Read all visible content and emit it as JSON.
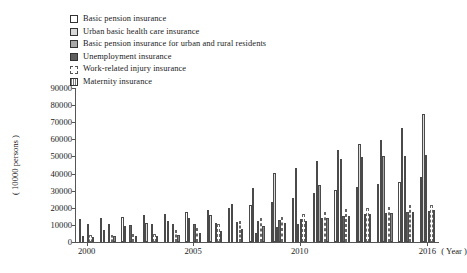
{
  "chart_data": {
    "type": "bar",
    "title": "",
    "xlabel": "( Year )",
    "ylabel": "( 10000 persons )",
    "ylim": [
      0,
      90000
    ],
    "ytick_values": [
      0,
      10000,
      20000,
      30000,
      40000,
      50000,
      60000,
      70000,
      80000,
      90000
    ],
    "ytick_labels": [
      "0",
      "10000",
      "20000",
      "30000",
      "40000",
      "50000",
      "60000",
      "70000",
      "80000",
      "90000"
    ],
    "grid": false,
    "legend_position": "top-left",
    "categories": [
      "2000",
      "2001",
      "2002",
      "2003",
      "2004",
      "2005",
      "2006",
      "2007",
      "2008",
      "2009",
      "2010",
      "2011",
      "2012",
      "2013",
      "2014",
      "2015",
      "2016"
    ],
    "xtick_labels": [
      "2000",
      "2005",
      "2010",
      "2016"
    ],
    "xtick_categories": [
      "2000",
      "2005",
      "2010",
      "2016"
    ],
    "series": [
      {
        "name": "Basic pension insurance",
        "swatch": "s0",
        "bar": "b0",
        "values": [
          13617,
          14183,
          14737,
          15507,
          16353,
          17488,
          18766,
          20137,
          21891,
          23550,
          25707,
          28391,
          30427,
          32218,
          34124,
          35361,
          37930
        ]
      },
      {
        "name": "Urban basic health care insurance",
        "swatch": "s1",
        "bar": "b1",
        "values": [
          3787,
          7286,
          9400,
          10902,
          12404,
          13783,
          15732,
          22311,
          31822,
          40147,
          43263,
          47343,
          53641,
          57073,
          59747,
          66582,
          74839
        ]
      },
      {
        "name": "Basic pension insurance for urban and rural residents",
        "swatch": "s2",
        "bar": "b2",
        "values": [
          0,
          0,
          0,
          0,
          0,
          0,
          0,
          0,
          5171,
          8691,
          10277,
          33218,
          48370,
          49750,
          50107,
          50472,
          50847
        ]
      },
      {
        "name": "Unemployment insurance",
        "swatch": "s3",
        "bar": "b3",
        "values": [
          10408,
          10355,
          10182,
          10373,
          10584,
          10648,
          11187,
          11645,
          12400,
          12715,
          13376,
          14317,
          15225,
          16417,
          17043,
          17326,
          18089
        ]
      },
      {
        "name": "Work-related injury insurance",
        "swatch": "s4",
        "bar": "b4",
        "values": [
          4350,
          4345,
          4406,
          4575,
          6845,
          8478,
          10268,
          12173,
          13787,
          14896,
          16161,
          17696,
          19010,
          19917,
          20639,
          21432,
          21889
        ]
      },
      {
        "name": "Maternity insurance",
        "swatch": "s5",
        "bar": "b5",
        "values": [
          3002,
          3455,
          3488,
          3655,
          4384,
          5408,
          6459,
          7775,
          9254,
          10876,
          12336,
          13892,
          15429,
          16392,
          17039,
          17771,
          18451
        ]
      }
    ]
  },
  "legend": {
    "items": [
      {
        "label": "Basic pension insurance"
      },
      {
        "label": "Urban basic health care insurance"
      },
      {
        "label": "Basic pension insurance for urban and rural residents"
      },
      {
        "label": "Unemployment insurance"
      },
      {
        "label": "Work-related injury insurance"
      },
      {
        "label": "Maternity insurance"
      }
    ]
  }
}
